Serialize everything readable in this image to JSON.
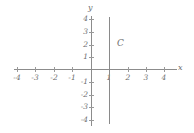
{
  "chart_data": {
    "type": "line",
    "title": "",
    "xlabel": "x",
    "ylabel": "y",
    "xlim": [
      -4.5,
      4.5
    ],
    "ylim": [
      -4.5,
      4.5
    ],
    "grid": false,
    "legend": "none",
    "x_ticks": [
      "-4",
      "-3",
      "-2",
      "-1",
      "1",
      "2",
      "3",
      "4"
    ],
    "y_ticks": [
      "4",
      "3",
      "2",
      "1",
      "-1",
      "-2",
      "-3",
      "-4"
    ],
    "series": [
      {
        "name": "C",
        "label": "C",
        "description": "vertical line x = 1",
        "equation": "x = 1",
        "x": [
          1,
          1
        ],
        "y": [
          -4,
          4
        ],
        "color": "#8a8a8a"
      }
    ],
    "annotations": [
      {
        "text": "C",
        "x": 1.45,
        "y": 2.3
      }
    ]
  },
  "axes": {
    "x_name": "x",
    "y_name": "y",
    "x_ticks": [
      {
        "value": -4,
        "label": "-4",
        "px": 17
      },
      {
        "value": -3,
        "label": "-3",
        "px": 35
      },
      {
        "value": -2,
        "label": "-2",
        "px": 54
      },
      {
        "value": -1,
        "label": "-1",
        "px": 72
      },
      {
        "value": 1,
        "label": "1",
        "px": 109
      },
      {
        "value": 2,
        "label": "2",
        "px": 128
      },
      {
        "value": 3,
        "label": "3",
        "px": 146
      },
      {
        "value": 4,
        "label": "4",
        "px": 164
      }
    ],
    "y_ticks": [
      {
        "value": 4,
        "label": "4",
        "px": 19
      },
      {
        "value": 3,
        "label": "3",
        "px": 32
      },
      {
        "value": 2,
        "label": "2",
        "px": 45
      },
      {
        "value": 1,
        "label": "1",
        "px": 57
      },
      {
        "value": -1,
        "label": "-1",
        "px": 82
      },
      {
        "value": -2,
        "label": "-2",
        "px": 95
      },
      {
        "value": -3,
        "label": "-3",
        "px": 107
      },
      {
        "value": -4,
        "label": "-4",
        "px": 120
      }
    ]
  },
  "colors": {
    "axis": "#8c8c8c",
    "line": "#8a8a8a",
    "text": "#6e6e6e",
    "background": "#ffffff"
  }
}
